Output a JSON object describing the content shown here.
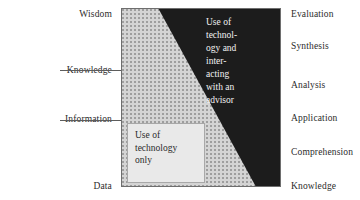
{
  "figure": {
    "left_axis": {
      "name": "DIKW hierarchy",
      "items": [
        {
          "label": "Wisdom",
          "top": 9
        },
        {
          "label": "Knowledge",
          "top": 65
        },
        {
          "label": "Information",
          "top": 114
        },
        {
          "label": "Data",
          "top": 181
        }
      ]
    },
    "right_axis": {
      "name": "Bloom's taxonomy",
      "items": [
        {
          "label": "Evaluation",
          "top": 9
        },
        {
          "label": "Synthesis",
          "top": 41
        },
        {
          "label": "Analysis",
          "top": 80
        },
        {
          "label": "Application",
          "top": 113
        },
        {
          "label": "Comprehension",
          "top": 147
        },
        {
          "label": "Knowledge",
          "top": 181
        }
      ]
    },
    "leaders": [
      {
        "name": "knowledge-leader",
        "left": 60,
        "top": 70,
        "width": 62
      },
      {
        "name": "information-leader",
        "left": 60,
        "top": 120,
        "width": 62
      }
    ],
    "dark_region": {
      "text": "Use of\ntechnol-\nogy and\ninter-\nacting\nwith an\nadvisor",
      "color": "#1c1c1c",
      "text_color": "#f2f2f2"
    },
    "light_region": {
      "text": "Use of\ntechnology\nonly",
      "color": "#e9e9e9",
      "text_color": "#2b2b2b"
    },
    "stipple_region": {
      "color": "#d4d4d4",
      "dot_color": "#9a9a9a"
    },
    "border_color": "#6e6e6e"
  }
}
